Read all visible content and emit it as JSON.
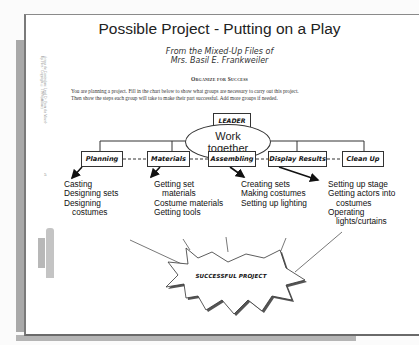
{
  "page": {
    "title": "Possible Project - Putting on a Play",
    "subtitle_line1": "From the Mixed-Up Files of",
    "subtitle_line2": "Mrs. Basil E. Frankweiler",
    "section_heading": "Organize for Success",
    "instructions_line1": "You are planning a project.  Fill in the chart below to show what groups are necessary to carry out this project.",
    "instructions_line2": "Then show the steps each group will take to make their part successful.  Add more groups if needed.",
    "side_text": "Across the Curriculum: Level D · From the Mixed-Up Files · Copyright © 1999 (affiliate)",
    "page_number": "5"
  },
  "chart": {
    "leader_label": "LEADER",
    "center_oval_line1": "Work",
    "center_oval_line2": "together",
    "groups": [
      {
        "label": "Planning",
        "steps": [
          "Casting",
          "Designing sets",
          "Designing",
          "costumes"
        ]
      },
      {
        "label": "Materials",
        "steps": [
          "Getting set",
          "materials",
          "Costume materials",
          "Getting tools"
        ]
      },
      {
        "label": "Assembling",
        "steps": [
          "Creating sets",
          "Making costumes",
          "Setting up lighting"
        ]
      },
      {
        "label": "Display Results",
        "steps": [
          "Setting up stage",
          "Getting actors into",
          "costumes",
          "Operating",
          "lights/curtains"
        ]
      },
      {
        "label": "Clean Up",
        "steps": []
      }
    ],
    "outcome_label": "SUCCESSFUL PROJECT"
  },
  "colors": {
    "line": "#333333",
    "page_background": "#ffffff",
    "border_gray": "#7a7a7a",
    "strip_gray": "#a9a9a9"
  }
}
